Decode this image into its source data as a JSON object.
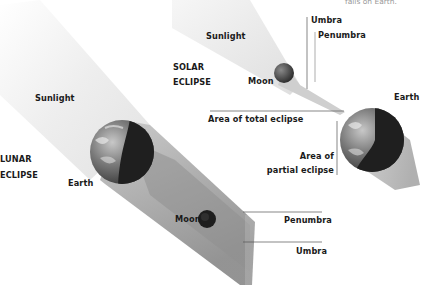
{
  "caption_top": "falls on Earth.",
  "solar": {
    "title_line1": "SOLAR",
    "title_line2": "ECLIPSE",
    "sunlight": "Sunlight",
    "moon": "Moon",
    "earth": "Earth",
    "umbra": "Umbra",
    "penumbra": "Penumbra",
    "area_total": "Area of total eclipse",
    "area_partial_line1": "Area of",
    "area_partial_line2": "partial eclipse"
  },
  "lunar": {
    "title_line1": "LUNAR",
    "title_line2": "ECLIPSE",
    "sunlight": "Sunlight",
    "earth": "Earth",
    "moon": "Moon",
    "penumbra": "Penumbra",
    "umbra": "Umbra"
  },
  "colors": {
    "label": "#1a1a1a",
    "leader_line": "#444444",
    "beam_light": "#f2f2f2",
    "shadow_gray": "#9c9c9c",
    "earth_dark": "#2a2a2a",
    "moon_dark": "#1e1e1e"
  }
}
